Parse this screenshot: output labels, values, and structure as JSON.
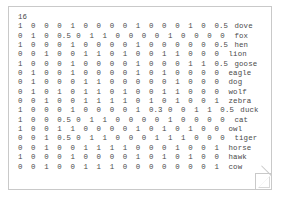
{
  "document": {
    "header": "16",
    "columns_label": "binary feature columns",
    "rows": [
      {
        "name": "dove",
        "values": [
          "1",
          "0",
          "0",
          "0",
          "1",
          "0",
          "0",
          "0",
          "0",
          "1",
          "0",
          "0",
          "0",
          "1",
          "0",
          "0.5"
        ]
      },
      {
        "name": "fox",
        "values": [
          "0",
          "1",
          "0",
          "0.5",
          "0",
          "1",
          "1",
          "0",
          "0",
          "0",
          "0",
          "1",
          "0",
          "0",
          "0",
          "0"
        ]
      },
      {
        "name": "hen",
        "values": [
          "1",
          "0",
          "0",
          "0",
          "1",
          "0",
          "0",
          "0",
          "0",
          "1",
          "0",
          "0",
          "0",
          "0",
          "0",
          "0.5"
        ]
      },
      {
        "name": "lion",
        "values": [
          "0",
          "0",
          "1",
          "0",
          "0",
          "1",
          "1",
          "0",
          "1",
          "0",
          "0",
          "1",
          "1",
          "0",
          "0",
          "0"
        ]
      },
      {
        "name": "goose",
        "values": [
          "1",
          "0",
          "0",
          "0",
          "1",
          "0",
          "0",
          "0",
          "0",
          "1",
          "0",
          "0",
          "0",
          "1",
          "1",
          "0.5"
        ]
      },
      {
        "name": "eagle",
        "values": [
          "0",
          "1",
          "0",
          "0",
          "1",
          "0",
          "0",
          "0",
          "0",
          "1",
          "0",
          "1",
          "0",
          "0",
          "0",
          "0"
        ]
      },
      {
        "name": "dog",
        "values": [
          "0",
          "1",
          "0",
          "0",
          "0",
          "1",
          "1",
          "0",
          "0",
          "0",
          "0",
          "0",
          "1",
          "0",
          "0",
          "0"
        ]
      },
      {
        "name": "wolf",
        "values": [
          "0",
          "1",
          "0",
          "1",
          "0",
          "1",
          "1",
          "0",
          "1",
          "0",
          "0",
          "1",
          "1",
          "0",
          "0",
          "0"
        ]
      },
      {
        "name": "zebra",
        "values": [
          "0",
          "0",
          "1",
          "0",
          "0",
          "1",
          "1",
          "1",
          "1",
          "0",
          "1",
          "0",
          "1",
          "0",
          "0",
          "1"
        ]
      },
      {
        "name": "duck",
        "values": [
          "1",
          "0",
          "0",
          "0",
          "1",
          "0",
          "0",
          "0",
          "0",
          "1",
          "0.3",
          "0",
          "0",
          "1",
          "1",
          "0.5"
        ]
      },
      {
        "name": "cat",
        "values": [
          "1",
          "0",
          "0",
          "0.5",
          "0",
          "1",
          "1",
          "0",
          "0",
          "0",
          "0",
          "1",
          "0",
          "0",
          "0",
          "0"
        ]
      },
      {
        "name": "owl",
        "values": [
          "1",
          "0",
          "0",
          "1",
          "1",
          "0",
          "0",
          "0",
          "0",
          "1",
          "0",
          "1",
          "0",
          "1",
          "0",
          "0"
        ]
      },
      {
        "name": "tiger",
        "values": [
          "0",
          "0",
          "1",
          "0.5",
          "0",
          "1",
          "1",
          "0",
          "0",
          "0",
          "1",
          "1",
          "1",
          "0",
          "0",
          "0"
        ]
      },
      {
        "name": "horse",
        "values": [
          "0",
          "0",
          "1",
          "0",
          "0",
          "1",
          "1",
          "1",
          "1",
          "0",
          "0",
          "0",
          "1",
          "0",
          "0",
          "1"
        ]
      },
      {
        "name": "hawk",
        "values": [
          "1",
          "0",
          "0",
          "0",
          "1",
          "0",
          "0",
          "0",
          "0",
          "1",
          "0",
          "1",
          "0",
          "1",
          "0",
          "0"
        ]
      },
      {
        "name": "cow",
        "values": [
          "0",
          "0",
          "1",
          "0",
          "0",
          "1",
          "1",
          "1",
          "0",
          "0",
          "0",
          "0",
          "0",
          "0",
          "0",
          "1"
        ]
      }
    ]
  },
  "style": {
    "page_background": "#ffffff",
    "page_border": "#c9c9c9",
    "text_color": "#4a4a4a",
    "fold_color": "#d8d8d8"
  }
}
